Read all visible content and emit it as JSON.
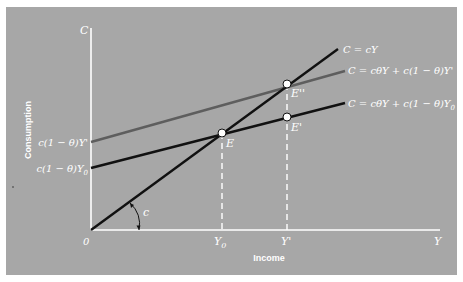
{
  "figure": {
    "background_color": "#a7a7a7",
    "axis_color": "#ffffff",
    "axes": {
      "y_axis_symbol": "C",
      "x_axis_symbol": "Y",
      "origin_label": "0",
      "y_axis_title": "Consumption",
      "x_axis_title": "Income"
    },
    "x_ticks": {
      "y0": "Y",
      "y0_sub": "0",
      "yprime": "Y'"
    },
    "y_ticks": {
      "upper_intercept": "c(1 − θ)Y'",
      "lower_intercept_main": "c(1 − θ)Y",
      "lower_intercept_sub": "0"
    },
    "lines": [
      {
        "id": "line-cy",
        "label": "C = cY",
        "color": "#111111"
      },
      {
        "id": "line-upper",
        "label": "C = cθY + c(1 − θ)Y'",
        "color": "#5e5e5e"
      },
      {
        "id": "line-lower",
        "label_main": "C = cθY + c(1 − θ)Y",
        "label_sub": "0",
        "color": "#111111"
      }
    ],
    "points": {
      "E": "E",
      "E_prime": "E'",
      "E_double_prime": "E''"
    },
    "slope_label": "c"
  }
}
